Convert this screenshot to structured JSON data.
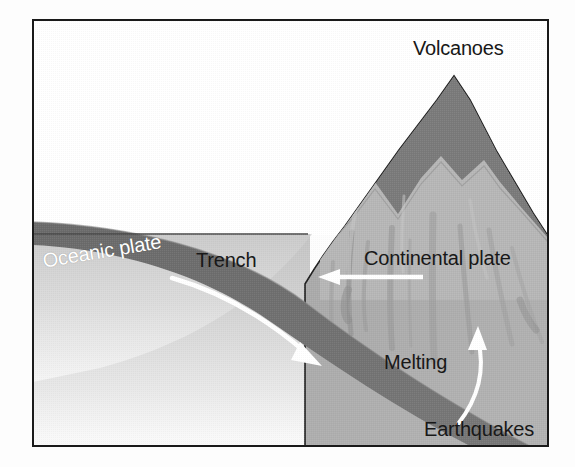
{
  "figure": {
    "type": "geology-cross-section-diagram",
    "frame": {
      "border_color": "#1a1a1a",
      "background_color": "#ffffff"
    },
    "palette": {
      "sky": "#ffffff",
      "water": "#cfcfcf",
      "ocean_floor_light": "#d9d9d9",
      "oceanic_slab_dark": "#6e6e6e",
      "continental_plate": "#a8a8a8",
      "volcano_upper_dark": "#787878",
      "volcano_snow_light": "#b9b9b9",
      "outline": "#1a1a1a",
      "arrow_white": "#ffffff",
      "label_dark": "#181818",
      "label_light": "#ffffff"
    },
    "labels": [
      {
        "id": "volcanoes",
        "text": "Volcanoes",
        "color": "dark"
      },
      {
        "id": "trench",
        "text": "Trench",
        "color": "dark"
      },
      {
        "id": "continental_plate",
        "text": "Continental plate",
        "color": "dark"
      },
      {
        "id": "melting",
        "text": "Melting",
        "color": "dark"
      },
      {
        "id": "earthquakes",
        "text": "Earthquakes",
        "color": "dark"
      },
      {
        "id": "oceanic_plate",
        "text": "Oceanic plate",
        "color": "light"
      }
    ],
    "arrows": [
      {
        "id": "subduction-arrow",
        "description": "white arrow inside oceanic slab pointing down-right (subduction direction)",
        "color": "#ffffff"
      },
      {
        "id": "continental-motion-arrow",
        "description": "white straight arrow pointing left (continental plate motion)",
        "color": "#ffffff"
      },
      {
        "id": "melting-rise-arrow",
        "description": "white curved arrow pointing up (rising melt)",
        "color": "#ffffff"
      }
    ]
  },
  "text": {
    "volcanoes": "Volcanoes",
    "trench": "Trench",
    "continental_plate": "Continental plate",
    "melting": "Melting",
    "earthquakes": "Earthquakes",
    "oceanic_plate": "Oceanic plate"
  }
}
